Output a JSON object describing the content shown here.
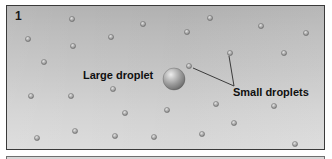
{
  "figure": {
    "panel_number": "1",
    "caption_labels": {
      "large": "Large droplet",
      "small": "Small droplets"
    },
    "colors": {
      "panel_top": "#b3b3b3",
      "panel_bottom": "#dcdcdc",
      "border": "#3a3a3a",
      "text": "#101010",
      "leader_line": "#2b2b2b",
      "droplet_fill": "#8f8f8f",
      "droplet_highlight": "#e4e4e4",
      "large_droplet_highlight": "#ededed",
      "large_droplet_shadow": "#6b6b6b"
    }
  },
  "chart_data": {
    "type": "scatter",
    "xlabel": "",
    "ylabel": "",
    "xlim": [
      0,
      319
    ],
    "ylim": [
      0,
      145
    ],
    "grid": false,
    "legend_position": "none",
    "series": [
      {
        "name": "Large droplet",
        "radius": 11,
        "points": [
          {
            "x": 167,
            "y": 73
          }
        ]
      },
      {
        "name": "Small droplets",
        "radius": 2.6,
        "points": [
          {
            "x": 65,
            "y": 13
          },
          {
            "x": 136,
            "y": 18
          },
          {
            "x": 203,
            "y": 12
          },
          {
            "x": 21,
            "y": 33
          },
          {
            "x": 104,
            "y": 31
          },
          {
            "x": 180,
            "y": 26
          },
          {
            "x": 254,
            "y": 20
          },
          {
            "x": 299,
            "y": 27
          },
          {
            "x": 66,
            "y": 40
          },
          {
            "x": 37,
            "y": 56
          },
          {
            "x": 223,
            "y": 47
          },
          {
            "x": 277,
            "y": 47
          },
          {
            "x": 182,
            "y": 60
          },
          {
            "x": 106,
            "y": 83
          },
          {
            "x": 24,
            "y": 90
          },
          {
            "x": 64,
            "y": 90
          },
          {
            "x": 209,
            "y": 98
          },
          {
            "x": 160,
            "y": 104
          },
          {
            "x": 118,
            "y": 107
          },
          {
            "x": 267,
            "y": 100
          },
          {
            "x": 227,
            "y": 117
          },
          {
            "x": 68,
            "y": 125
          },
          {
            "x": 30,
            "y": 132
          },
          {
            "x": 108,
            "y": 130
          },
          {
            "x": 147,
            "y": 131
          },
          {
            "x": 195,
            "y": 128
          },
          {
            "x": 288,
            "y": 138
          }
        ]
      }
    ],
    "annotations": [
      {
        "text": "Large droplet",
        "x": 76,
        "y": 73,
        "anchor": "start"
      },
      {
        "text": "Small droplets",
        "x": 226,
        "y": 90,
        "anchor": "start"
      }
    ],
    "leaders": [
      {
        "name": "leader-to-left-droplet",
        "from_x": 227,
        "from_y": 80,
        "to_x": 186,
        "to_y": 62
      },
      {
        "name": "leader-to-upper-droplet",
        "from_x": 227,
        "from_y": 80,
        "to_x": 222,
        "to_y": 50
      }
    ]
  }
}
